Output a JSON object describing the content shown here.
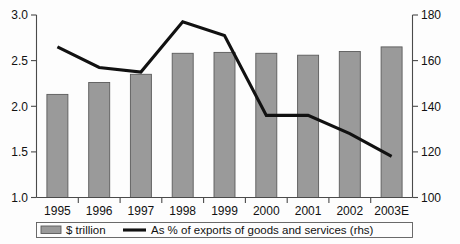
{
  "chart_data": {
    "type": "bar",
    "title": "",
    "subtitle": "",
    "xlabel": "",
    "ylabel": "",
    "grid": false,
    "legend_position": "bottom",
    "categories": [
      "1995",
      "1996",
      "1997",
      "1998",
      "1999",
      "2000",
      "2001",
      "2002",
      "2003E"
    ],
    "series": [
      {
        "name": "$ trillion",
        "type": "bar",
        "axis": "left",
        "values": [
          2.13,
          2.26,
          2.35,
          2.58,
          2.59,
          2.58,
          2.56,
          2.6,
          2.65
        ]
      },
      {
        "name": "As % of exports of goods and services (rhs)",
        "type": "line",
        "axis": "right",
        "values": [
          166,
          157,
          155,
          177,
          171,
          136,
          136,
          128,
          118
        ]
      }
    ],
    "left_axis": {
      "label": "",
      "ylim": [
        1.0,
        3.0
      ],
      "ticks": [
        1.0,
        1.5,
        2.0,
        2.5,
        3.0
      ],
      "tick_labels": [
        "1.0",
        "1.5",
        "2.0",
        "2.5",
        "3.0"
      ]
    },
    "right_axis": {
      "label": "",
      "ylim": [
        100,
        180
      ],
      "ticks": [
        100,
        120,
        140,
        160,
        180
      ],
      "tick_labels": [
        "100",
        "120",
        "140",
        "160",
        "180"
      ]
    },
    "legend": [
      {
        "label": "$ trillion",
        "marker": "bar-swatch",
        "color": "#9a9a9a"
      },
      {
        "label": "As % of exports of goods and services (rhs)",
        "marker": "line-swatch",
        "color": "#111111"
      }
    ],
    "colors": {
      "bar_fill": "#9a9a9a",
      "bar_stroke": "#5b5b5b",
      "line": "#111111",
      "axis": "#4a4a4a",
      "background": "#fdfdfd",
      "text": "#111111"
    }
  }
}
